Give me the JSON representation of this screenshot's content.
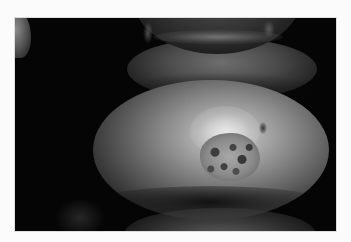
{
  "image": {
    "kind": "clinical photograph",
    "tone": "grayscale",
    "subject": "chin with crusted skin lesion",
    "regions": [
      {
        "name": "lower-lip",
        "position": "top-center"
      },
      {
        "name": "chin",
        "position": "center"
      },
      {
        "name": "lesion",
        "position": "center-right"
      },
      {
        "name": "neck",
        "position": "bottom-center"
      }
    ],
    "colors": {
      "background_page": "#fbfbfb",
      "photo_background": "#050505",
      "skin_highlight": "#d9d9d9",
      "lesion_crust": "#3d3d3d"
    }
  }
}
